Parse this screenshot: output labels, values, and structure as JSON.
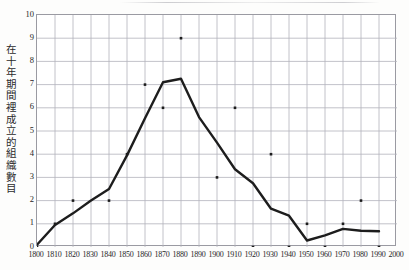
{
  "chart_data": {
    "type": "line",
    "title": "",
    "subtitle": "",
    "xlabel": "",
    "ylabel": "在十年期間裡成立的組織數目",
    "xlim": [
      1800,
      2000
    ],
    "ylim": [
      0,
      10
    ],
    "grid": true,
    "legend": "none",
    "x_ticks": [
      "1800",
      "1810",
      "1820",
      "1830",
      "1840",
      "1850",
      "1860",
      "1870",
      "1880",
      "1890",
      "1900",
      "1910",
      "1920",
      "1930",
      "1940",
      "1950",
      "1960",
      "1970",
      "1980",
      "1990",
      "2000"
    ],
    "y_ticks": [
      "0",
      "1",
      "2",
      "3",
      "4",
      "5",
      "6",
      "7",
      "8",
      "9",
      "10"
    ],
    "series": [
      {
        "name": "trend-line",
        "type": "line",
        "color": "#1d1d1d",
        "x": [
          1800,
          1810,
          1820,
          1830,
          1840,
          1850,
          1860,
          1870,
          1880,
          1890,
          1900,
          1910,
          1920,
          1930,
          1940,
          1950,
          1960,
          1970,
          1980,
          1990
        ],
        "values": [
          0.1,
          0.95,
          1.45,
          2.0,
          2.5,
          3.95,
          5.55,
          7.1,
          7.25,
          5.6,
          4.5,
          3.35,
          2.75,
          1.65,
          1.35,
          0.28,
          0.5,
          0.78,
          0.7,
          0.68
        ]
      },
      {
        "name": "data-points",
        "type": "scatter",
        "color": "#1d1d1d",
        "x": [
          1800,
          1810,
          1820,
          1840,
          1850,
          1860,
          1870,
          1880,
          1900,
          1910,
          1920,
          1930,
          1940,
          1950,
          1960,
          1970,
          1980,
          1990
        ],
        "values": [
          0,
          1,
          2,
          2,
          4,
          7,
          6,
          9,
          3,
          6,
          0,
          4,
          0,
          1,
          0,
          1,
          2,
          0
        ]
      }
    ]
  },
  "axes": {
    "y_label_text": "在十年期間裡成立的組織數目",
    "y_tick_labels": [
      "10",
      "9",
      "8",
      "7",
      "6",
      "5",
      "4",
      "3",
      "2",
      "1",
      "0"
    ],
    "x_tick_labels": [
      "1800",
      "1810",
      "1820",
      "1830",
      "1840",
      "1850",
      "1860",
      "1870",
      "1880",
      "1890",
      "1900",
      "1910",
      "1920",
      "1930",
      "1940",
      "1950",
      "1960",
      "1970",
      "1980",
      "1990",
      "2000"
    ]
  }
}
